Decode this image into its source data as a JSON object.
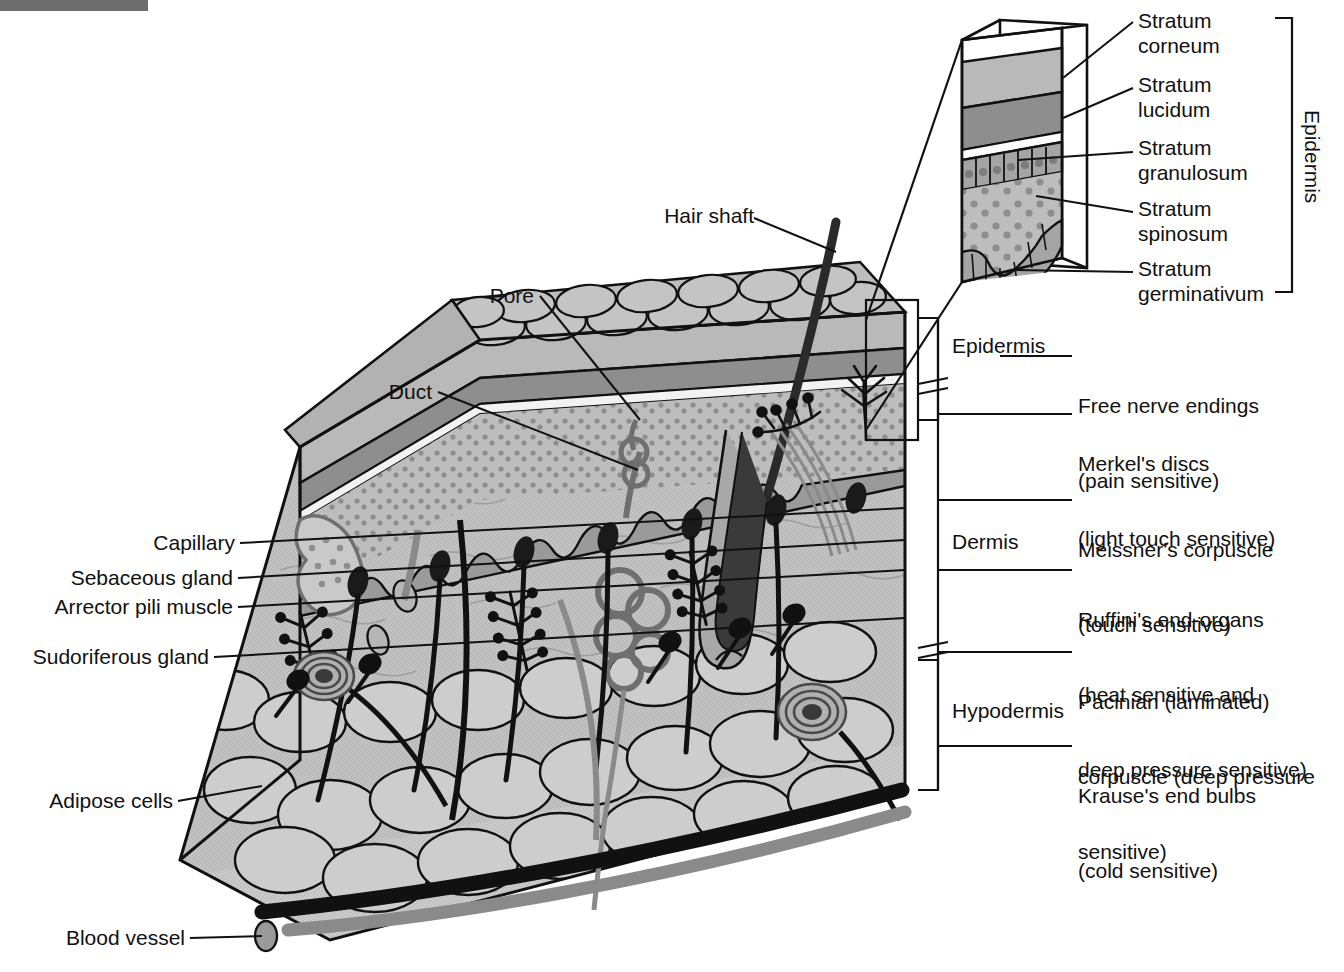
{
  "diagram": {
    "colors": {
      "stroke": "#111111",
      "corneum_fill": "#b9b9b9",
      "lucidum_fill": "#8e8e8e",
      "granulosum_fill": "#a5a5a5",
      "spinosum_fill": "#bdbdbd",
      "dermis_fill": "#c2c2c2",
      "hypodermis_fill": "#c9c9c9",
      "vessel_dark": "#111111",
      "vessel_gray": "#8a8a8a",
      "artifact_bar": "#6d6d6d"
    }
  },
  "inset": {
    "name": "epidermis-magnification-inset",
    "bracket_label": "Epidermis",
    "layers": [
      {
        "id": "corneum",
        "label": "Stratum\ncorneum"
      },
      {
        "id": "lucidum",
        "label": "Stratum\nlucidum"
      },
      {
        "id": "granulosum",
        "label": "Stratum\ngranulosum"
      },
      {
        "id": "spinosum",
        "label": "Stratum\nspinosum"
      },
      {
        "id": "germinativum",
        "label": "Stratum\ngerminativum"
      }
    ]
  },
  "labels_top": [
    {
      "id": "hair-shaft",
      "text": "Hair shaft"
    },
    {
      "id": "pore",
      "text": "Pore"
    },
    {
      "id": "duct",
      "text": "Duct"
    }
  ],
  "labels_left": [
    {
      "id": "capillary",
      "text": "Capillary"
    },
    {
      "id": "sebaceous-gland",
      "text": "Sebaceous gland"
    },
    {
      "id": "arrector-pili-muscle",
      "text": "Arrector pili muscle"
    },
    {
      "id": "sudoriferous-gland",
      "text": "Sudoriferous gland"
    },
    {
      "id": "adipose-cells",
      "text": "Adipose cells"
    },
    {
      "id": "blood-vessel",
      "text": "Blood vessel"
    }
  ],
  "layer_brackets": [
    {
      "id": "epidermis",
      "text": "Epidermis"
    },
    {
      "id": "dermis",
      "text": "Dermis"
    },
    {
      "id": "hypodermis",
      "text": "Hypodermis"
    }
  ],
  "labels_right": [
    {
      "id": "free-nerve-endings",
      "line1": "Free nerve endings",
      "line2": "(pain sensitive)"
    },
    {
      "id": "merkels-discs",
      "line1": "Merkel's discs",
      "line2": "(light touch sensitive)"
    },
    {
      "id": "meissners-corpuscle",
      "line1": "Meissner's corpuscle",
      "line2": "(touch sensitive)"
    },
    {
      "id": "ruffinis-end-organs",
      "line1": "Ruffini's end-organs",
      "line2": "(heat sensitive and",
      "line3": "deep pressure sensitive)"
    },
    {
      "id": "pacinian-corpuscle",
      "line1": "Pacinian (laminated)",
      "line2": "corpuscle (deep pressure",
      "line3": "sensitive)"
    },
    {
      "id": "krauses-end-bulbs",
      "line1": "Krause's end bulbs",
      "line2": "(cold sensitive)"
    }
  ]
}
